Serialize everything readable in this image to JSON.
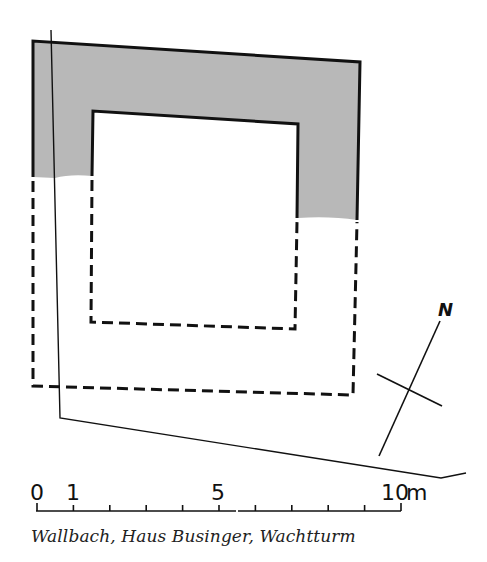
{
  "diagram": {
    "type": "archaeological-ground-plan",
    "colors": {
      "wall_fill": "#b8b8b8",
      "line": "#111111",
      "background": "#ffffff"
    },
    "legend_meaning": {
      "shaded_solid": "preserved / excavated masonry",
      "dashed": "reconstructed wall line"
    }
  },
  "north_arrow": {
    "label": "N"
  },
  "scale_bar": {
    "labels": {
      "zero": "0",
      "one": "1",
      "five": "5",
      "ten": "10",
      "unit": "m"
    },
    "ticks": 11
  },
  "caption": "Wallbach, Haus Businger, Wachtturm"
}
